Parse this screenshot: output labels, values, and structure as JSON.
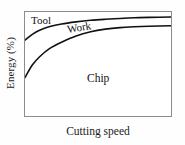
{
  "chart_data": {
    "type": "line",
    "title": "",
    "xlabel": "Cutting speed",
    "ylabel": "Energy (%)",
    "grid": false,
    "legend": "inline-region-labels",
    "xlim": [
      0,
      100
    ],
    "ylim": [
      0,
      100
    ],
    "axis_ticks": {
      "x": [],
      "y": []
    },
    "regions": [
      {
        "name": "Tool",
        "label": "Tool"
      },
      {
        "name": "Work",
        "label": "Work"
      },
      {
        "name": "Chip",
        "label": "Chip"
      }
    ],
    "series": [
      {
        "name": "Tool/Work boundary",
        "comment": "upper saturating curve: lower boundary of the Tool band",
        "x": [
          0,
          5,
          10,
          17,
          25,
          35,
          45,
          55,
          65,
          75,
          85,
          100
        ],
        "values": [
          73,
          78.5,
          82.5,
          86,
          88.5,
          90.5,
          92,
          93,
          93.8,
          94.4,
          94.8,
          95.2
        ]
      },
      {
        "name": "Work/Chip boundary",
        "comment": "lower saturating curve: lower boundary of the Work band",
        "x": [
          0,
          5,
          10,
          17,
          25,
          35,
          45,
          55,
          65,
          75,
          85,
          100
        ],
        "values": [
          37,
          49,
          57,
          65,
          71,
          77,
          81,
          83.5,
          85,
          85.8,
          86.3,
          86.8
        ]
      }
    ],
    "colors": {
      "curve": "#111111",
      "frame": "#8d8d8d",
      "background": "#ffffff",
      "text": "#1a1a1a"
    }
  }
}
